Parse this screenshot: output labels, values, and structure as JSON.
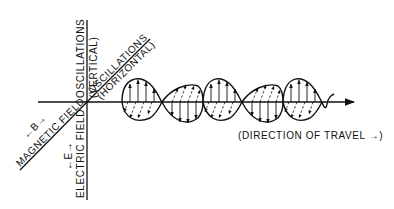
{
  "diagram": {
    "type": "electromagnetic-wave",
    "labels": {
      "vertical_top_1": "OSCILLATIONS",
      "vertical_top_2": "(VERTICAL)",
      "vertical_bottom": "ELECTRIC FIELD",
      "vertical_symbol": "←E→",
      "diagonal_top_1": "OSCILLATIONS",
      "diagonal_top_2": "(HORIZONTAL)",
      "diagonal_bottom": "MAGNETIC FIELD",
      "diagonal_symbol": "←B→",
      "direction": "(DIRECTION OF TRAVEL →)"
    },
    "colors": {
      "ink": "#111111",
      "background": "#ffffff"
    }
  }
}
